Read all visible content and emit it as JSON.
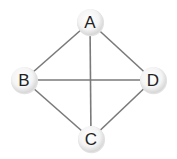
{
  "diagram": {
    "type": "undirected-graph",
    "colors": {
      "background": "#ffffff",
      "edge": "#7a7a7a",
      "node_center": "#ffffff",
      "node_edge": "#d8d8d8",
      "label": "#222222"
    },
    "nodes": [
      {
        "id": "A",
        "label": "A",
        "x": 90,
        "y": 22
      },
      {
        "id": "B",
        "label": "B",
        "x": 24,
        "y": 80
      },
      {
        "id": "C",
        "label": "C",
        "x": 91,
        "y": 139
      },
      {
        "id": "D",
        "label": "D",
        "x": 153,
        "y": 80
      }
    ],
    "edges": [
      {
        "from": "A",
        "to": "B"
      },
      {
        "from": "A",
        "to": "D"
      },
      {
        "from": "A",
        "to": "C"
      },
      {
        "from": "B",
        "to": "D"
      },
      {
        "from": "B",
        "to": "C"
      },
      {
        "from": "C",
        "to": "D"
      }
    ]
  }
}
